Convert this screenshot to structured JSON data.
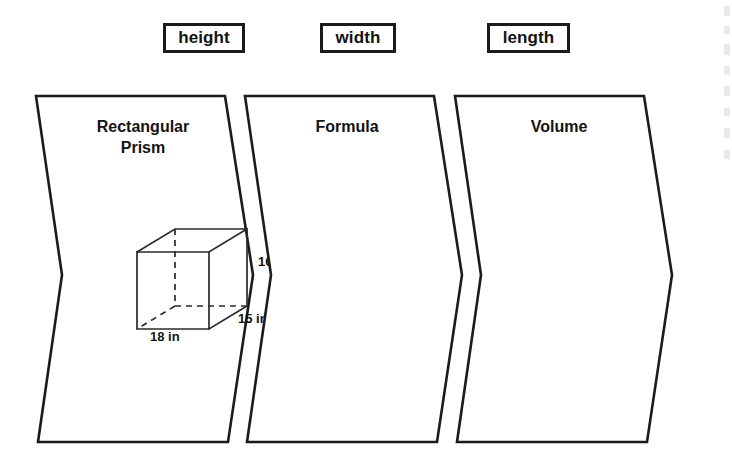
{
  "terms": [
    {
      "label": "height"
    },
    {
      "label": "width"
    },
    {
      "label": "length"
    }
  ],
  "panels": [
    {
      "heading": "Rectangular\nPrism",
      "content": ""
    },
    {
      "heading": "Formula",
      "content": ""
    },
    {
      "heading": "Volume",
      "content": ""
    }
  ],
  "figure": {
    "shape_name": "rectangular-prism",
    "dimensions": {
      "height": "16 in",
      "width": "15 in",
      "length": "18 in"
    }
  },
  "colors": {
    "outline": "#1b1b1b",
    "figure_stroke": "#2b2b2b",
    "text": "#121212",
    "background": "#ffffff"
  }
}
